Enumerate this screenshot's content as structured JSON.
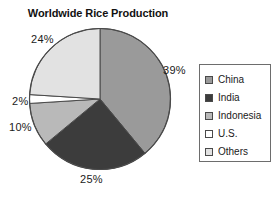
{
  "chart_data": {
    "type": "pie",
    "title": "Worldwide Rice Production",
    "xlabel": "",
    "ylabel": "",
    "legend_position": "right",
    "grid": false,
    "start_angle_deg": 0,
    "direction": "clockwise",
    "categories": [
      "China",
      "India",
      "Indonesia",
      "U.S.",
      "Others"
    ],
    "values": [
      39,
      25,
      10,
      2,
      24
    ],
    "value_unit": "%",
    "labels": [
      "39%",
      "25%",
      "10%",
      "2%",
      "24%"
    ],
    "colors": [
      "#9a9a9a",
      "#3c3c3c",
      "#b9b9b9",
      "#ffffff",
      "#e2e2e2"
    ],
    "slices": [
      {
        "name": "China",
        "value": 39,
        "label": "39%",
        "color": "#9a9a9a"
      },
      {
        "name": "India",
        "value": 25,
        "label": "25%",
        "color": "#3c3c3c"
      },
      {
        "name": "Indonesia",
        "value": 10,
        "label": "10%",
        "color": "#b9b9b9"
      },
      {
        "name": "U.S.",
        "value": 2,
        "label": "2%",
        "color": "#ffffff"
      },
      {
        "name": "Others",
        "value": 24,
        "label": "24%",
        "color": "#e2e2e2"
      }
    ]
  },
  "title": "Worldwide Rice Production",
  "slice_labels": {
    "china": "39%",
    "india": "25%",
    "indonesia": "10%",
    "us": "2%",
    "others": "24%"
  },
  "legend": {
    "items": [
      {
        "label": "China",
        "color": "#9a9a9a"
      },
      {
        "label": "India",
        "color": "#3c3c3c"
      },
      {
        "label": "Indonesia",
        "color": "#b9b9b9"
      },
      {
        "label": "U.S.",
        "color": "#ffffff"
      },
      {
        "label": "Others",
        "color": "#e2e2e2"
      }
    ]
  }
}
